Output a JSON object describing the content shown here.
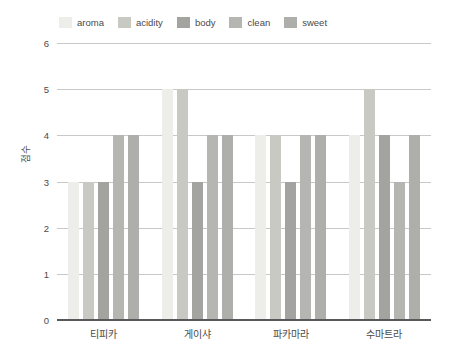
{
  "chart_data": {
    "type": "bar",
    "title": "",
    "subtitle": "",
    "xlabel": "",
    "ylabel": "점수",
    "ylim": [
      0,
      6
    ],
    "yticks": [
      0,
      1,
      2,
      3,
      4,
      5,
      6
    ],
    "grid": true,
    "grid_axis": "y",
    "legend_position": "top",
    "categories": [
      "티피카",
      "게이샤",
      "파카마라",
      "수마트라"
    ],
    "series": [
      {
        "name": "aroma",
        "values": [
          3,
          5,
          4,
          4
        ],
        "color": "#ededea"
      },
      {
        "name": "acidity",
        "values": [
          3,
          5,
          4,
          5
        ],
        "color": "#c9c9c4"
      },
      {
        "name": "body",
        "values": [
          3,
          3,
          3,
          4
        ],
        "color": "#a3a3a0"
      },
      {
        "name": "clean",
        "values": [
          4,
          4,
          4,
          3
        ],
        "color": "#b5b5b1"
      },
      {
        "name": "sweet",
        "values": [
          4,
          4,
          4,
          4
        ],
        "color": "#aeaeab"
      }
    ]
  },
  "legend": {
    "items": [
      {
        "label": "aroma"
      },
      {
        "label": "acidity"
      },
      {
        "label": "body"
      },
      {
        "label": "clean"
      },
      {
        "label": "sweet"
      }
    ]
  },
  "axes": {
    "y": {
      "title": "점수",
      "ticks": [
        "6",
        "5",
        "4",
        "3",
        "2",
        "1",
        "0"
      ]
    },
    "x": {
      "ticks": [
        "티피카",
        "게이샤",
        "파카마라",
        "수마트라"
      ]
    }
  },
  "colors": {
    "background": "#ffffff",
    "gridline": "#c8c8c8",
    "axis": "#58585a",
    "text": "#4a4a4a"
  }
}
